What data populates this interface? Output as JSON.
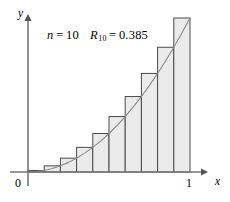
{
  "figure": {
    "background_color": "#ffffff",
    "annotation": {
      "n_symbol": "n",
      "n_equals": "=",
      "n_value": "10",
      "r_symbol": "R",
      "r_subscript": "10",
      "r_equals": "=",
      "r_value": "0.385"
    },
    "axes": {
      "y_label": "y",
      "x_label": "x",
      "origin_label": "0",
      "x_tick_label": "1",
      "axis_color": "#777777",
      "x_axis_y_px": 172,
      "y_axis_x_px": 28,
      "x_axis_start_px": 10,
      "x_axis_end_px": 208,
      "y_axis_top_px": 14,
      "y_axis_bottom_px": 186
    }
  },
  "chart_data": {
    "type": "bar",
    "title": "",
    "subtitle": "",
    "xlabel": "x",
    "ylabel": "y",
    "xlim": [
      0,
      1
    ],
    "ylim": [
      0,
      1
    ],
    "grid": false,
    "legend": "none",
    "annotations": [
      "n = 10",
      "R_10 = 0.385"
    ],
    "function": "y = x^2",
    "method": "right endpoint Riemann sum",
    "n": 10,
    "riemann_sum": 0.385,
    "bar_fill_color": "#ebebeb",
    "bar_edge_color": "#4a4a4a",
    "curve_color": "#8a8a8a",
    "categories": [
      "0.0-0.1",
      "0.1-0.2",
      "0.2-0.3",
      "0.3-0.4",
      "0.4-0.5",
      "0.5-0.6",
      "0.6-0.7",
      "0.7-0.8",
      "0.8-0.9",
      "0.9-1.0"
    ],
    "bar_left_edges": [
      0.0,
      0.1,
      0.2,
      0.3,
      0.4,
      0.5,
      0.6,
      0.7,
      0.8,
      0.9
    ],
    "bar_right_edges": [
      0.1,
      0.2,
      0.3,
      0.4,
      0.5,
      0.6,
      0.7,
      0.8,
      0.9,
      1.0
    ],
    "values": [
      0.01,
      0.04,
      0.09,
      0.16,
      0.25,
      0.36,
      0.49,
      0.64,
      0.81,
      1.0
    ],
    "curve_x": [
      0.0,
      0.05,
      0.1,
      0.15,
      0.2,
      0.25,
      0.3,
      0.35,
      0.4,
      0.45,
      0.5,
      0.55,
      0.6,
      0.65,
      0.7,
      0.75,
      0.8,
      0.85,
      0.9,
      0.95,
      1.0
    ],
    "curve_y": [
      0.0,
      0.0025,
      0.01,
      0.0225,
      0.04,
      0.0625,
      0.09,
      0.1225,
      0.16,
      0.2025,
      0.25,
      0.3025,
      0.36,
      0.4225,
      0.49,
      0.5625,
      0.64,
      0.7225,
      0.81,
      0.9025,
      1.0
    ],
    "x_ticks": [
      0,
      1
    ],
    "x_tick_labels": [
      "0",
      "1"
    ]
  }
}
